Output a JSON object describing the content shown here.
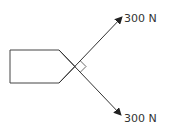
{
  "diagram": {
    "forces": [
      {
        "label": "300 N",
        "direction": "up-right"
      },
      {
        "label": "300 N",
        "direction": "down-right"
      }
    ],
    "angle_marker": "right-angle",
    "object": "pentagon-block",
    "colors": {
      "line": "#333333",
      "background": "#ffffff"
    }
  }
}
